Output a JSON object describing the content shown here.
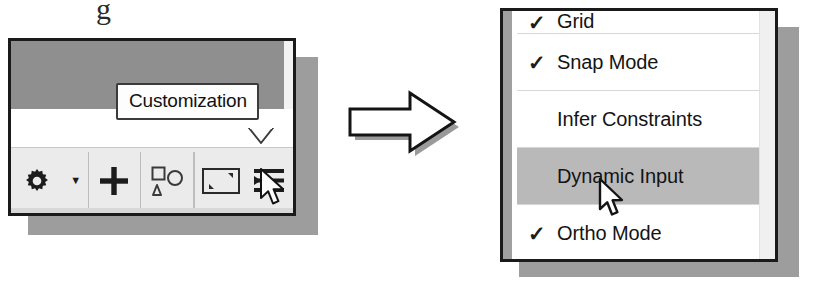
{
  "figure": {
    "arrow": {
      "name": "right-block-arrow",
      "direction": "right"
    },
    "scan_artifact": "g"
  },
  "left_panel": {
    "tooltip": {
      "label": "Customization"
    },
    "toolbar": {
      "buttons": [
        {
          "name": "gear-icon",
          "label": "Settings",
          "has_dropdown": true
        },
        {
          "name": "plus-icon",
          "label": "Add"
        },
        {
          "name": "shapes-icon",
          "label": "Shapes"
        },
        {
          "name": "clean-screen-icon",
          "label": "Clean Screen"
        },
        {
          "name": "customization-icon",
          "label": "Customization"
        }
      ],
      "dropdown_caret": "▼"
    }
  },
  "menu": {
    "title": "Customization menu",
    "checkmark": "✓",
    "items": [
      {
        "label": "Grid",
        "checked": true,
        "highlighted": false,
        "clipped": true
      },
      {
        "label": "Snap Mode",
        "checked": true,
        "highlighted": false,
        "clipped": false
      },
      {
        "label": "Infer Constraints",
        "checked": false,
        "highlighted": false,
        "clipped": false
      },
      {
        "label": "Dynamic Input",
        "checked": false,
        "highlighted": true,
        "clipped": false
      },
      {
        "label": "Ortho Mode",
        "checked": true,
        "highlighted": false,
        "clipped": false
      }
    ]
  },
  "colors": {
    "panel_border": "#1a1a1a",
    "panel_shadow": "#9d9d9d",
    "toolbar_bg": "#ebebeb",
    "menu_bg": "#ffffff",
    "menu_highlight": "#b9b9b9",
    "top_band": "#8f8f8f",
    "text": "#141414"
  }
}
